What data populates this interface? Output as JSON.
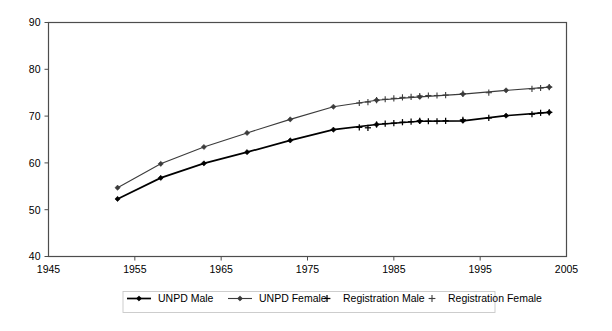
{
  "chart_data": {
    "type": "line",
    "title": "",
    "subtitle": "",
    "xlabel": "",
    "ylabel": "",
    "xlim": [
      1945,
      2005
    ],
    "ylim": [
      40,
      90
    ],
    "x_ticks": [
      1945,
      1955,
      1965,
      1975,
      1985,
      1995,
      2005
    ],
    "y_ticks": [
      40,
      50,
      60,
      70,
      80,
      90
    ],
    "grid": "horizontal",
    "legend_position": "bottom",
    "series": [
      {
        "name": "UNPD Male",
        "marker": "diamond",
        "color": "#000000",
        "line": true,
        "x": [
          1953,
          1958,
          1963,
          1968,
          1973,
          1978,
          1983,
          1988,
          1993,
          1998,
          2003
        ],
        "values": [
          52.3,
          56.8,
          59.9,
          62.3,
          64.8,
          67.1,
          68.2,
          68.9,
          69.0,
          70.1,
          70.8
        ]
      },
      {
        "name": "UNPD Female",
        "marker": "diamond",
        "color": "#3b3b3b",
        "line": true,
        "x": [
          1953,
          1958,
          1963,
          1968,
          1973,
          1978,
          1983,
          1988,
          1993,
          1998,
          2003
        ],
        "values": [
          54.7,
          59.8,
          63.4,
          66.4,
          69.3,
          72.0,
          73.4,
          74.1,
          74.7,
          75.5,
          76.2
        ]
      },
      {
        "name": "Registration Male",
        "marker": "plus",
        "color": "#000000",
        "line": false,
        "x": [
          1981,
          1982,
          1983,
          1984,
          1985,
          1986,
          1987,
          1988,
          1989,
          1990,
          1991,
          1993,
          1996,
          2001,
          2002,
          2003
        ],
        "values": [
          67.6,
          67.5,
          68.2,
          68.4,
          68.5,
          68.7,
          68.8,
          69.0,
          68.9,
          68.9,
          69.0,
          69.2,
          69.6,
          70.4,
          70.7,
          70.8
        ]
      },
      {
        "name": "Registration Female",
        "marker": "plus",
        "color": "#3b3b3b",
        "line": false,
        "x": [
          1981,
          1982,
          1983,
          1984,
          1985,
          1986,
          1987,
          1988,
          1989,
          1990,
          1991,
          1993,
          1996,
          2001,
          2002,
          2003
        ],
        "values": [
          72.8,
          73.0,
          73.4,
          73.6,
          73.8,
          74.0,
          74.1,
          74.3,
          74.4,
          74.4,
          74.5,
          74.8,
          75.0,
          75.8,
          76.0,
          76.2
        ]
      }
    ]
  },
  "axes": {
    "x_tick_labels": [
      "1945",
      "1955",
      "1965",
      "1975",
      "1985",
      "1995",
      "2005"
    ],
    "y_tick_labels": [
      "40",
      "50",
      "60",
      "70",
      "80",
      "90"
    ]
  },
  "legend": {
    "items": [
      {
        "label": "UNPD Male",
        "marker": "diamond-line",
        "color": "#000000"
      },
      {
        "label": "UNPD Female",
        "marker": "diamond-line",
        "color": "#3b3b3b"
      },
      {
        "label": "Registration Male",
        "marker": "plus",
        "color": "#000000"
      },
      {
        "label": "Registration Female",
        "marker": "plus",
        "color": "#3b3b3b"
      }
    ]
  }
}
